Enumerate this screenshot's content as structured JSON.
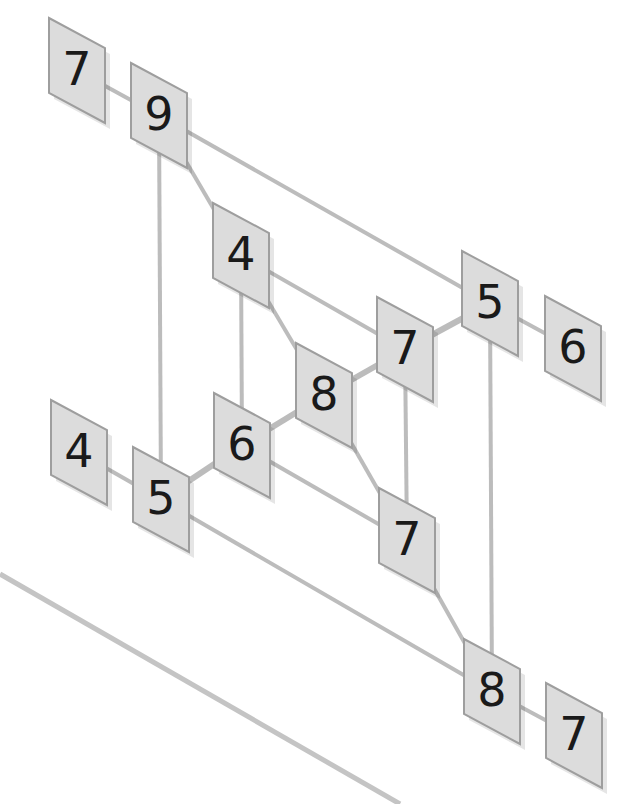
{
  "diagram": {
    "type": "skewed-node-graph",
    "colors": {
      "background": "#ffffff",
      "node_fill": "#dcdcdc",
      "node_border": "#9e9e9e",
      "edge": "#bcbcbc",
      "label": "#1a1a1a"
    },
    "nodes": [
      {
        "id": "n1",
        "label": "7",
        "x": 49,
        "y": 18
      },
      {
        "id": "n2",
        "label": "9",
        "x": 131,
        "y": 63
      },
      {
        "id": "n3",
        "label": "4",
        "x": 213,
        "y": 203
      },
      {
        "id": "n4",
        "label": "7",
        "x": 377,
        "y": 297
      },
      {
        "id": "n5",
        "label": "5",
        "x": 462,
        "y": 251
      },
      {
        "id": "n6",
        "label": "6",
        "x": 545,
        "y": 296
      },
      {
        "id": "n7",
        "label": "8",
        "x": 296,
        "y": 343
      },
      {
        "id": "n8",
        "label": "6",
        "x": 214,
        "y": 393
      },
      {
        "id": "n9",
        "label": "4",
        "x": 51,
        "y": 400
      },
      {
        "id": "n10",
        "label": "5",
        "x": 133,
        "y": 447
      },
      {
        "id": "n11",
        "label": "7",
        "x": 379,
        "y": 488
      },
      {
        "id": "n12",
        "label": "8",
        "x": 464,
        "y": 639
      },
      {
        "id": "n13",
        "label": "7",
        "x": 546,
        "y": 683
      }
    ],
    "edges": [
      {
        "from": "n1",
        "to": "n2",
        "weight": "thin"
      },
      {
        "from": "n2",
        "to": "n5",
        "weight": "thin"
      },
      {
        "from": "n2",
        "to": "n3",
        "weight": "thin"
      },
      {
        "from": "n2",
        "to": "n10",
        "weight": "thin"
      },
      {
        "from": "n3",
        "to": "n4",
        "weight": "thin"
      },
      {
        "from": "n3",
        "to": "n7",
        "weight": "thin"
      },
      {
        "from": "n3",
        "to": "n8",
        "weight": "thin"
      },
      {
        "from": "n4",
        "to": "n5",
        "weight": "thick"
      },
      {
        "from": "n4",
        "to": "n11",
        "weight": "thin"
      },
      {
        "from": "n5",
        "to": "n6",
        "weight": "thin"
      },
      {
        "from": "n5",
        "to": "n12",
        "weight": "thin"
      },
      {
        "from": "n7",
        "to": "n4",
        "weight": "thick"
      },
      {
        "from": "n7",
        "to": "n11",
        "weight": "thin"
      },
      {
        "from": "n8",
        "to": "n7",
        "weight": "thick"
      },
      {
        "from": "n8",
        "to": "n11",
        "weight": "thin"
      },
      {
        "from": "n9",
        "to": "n10",
        "weight": "thin"
      },
      {
        "from": "n10",
        "to": "n8",
        "weight": "thick"
      },
      {
        "from": "n10",
        "to": "n12",
        "weight": "thin"
      },
      {
        "from": "n11",
        "to": "n12",
        "weight": "thin"
      },
      {
        "from": "n12",
        "to": "n13",
        "weight": "thin"
      }
    ],
    "decorations": [
      {
        "type": "line",
        "x1": 0,
        "y1": 574,
        "x2": 400,
        "y2": 804
      }
    ]
  }
}
